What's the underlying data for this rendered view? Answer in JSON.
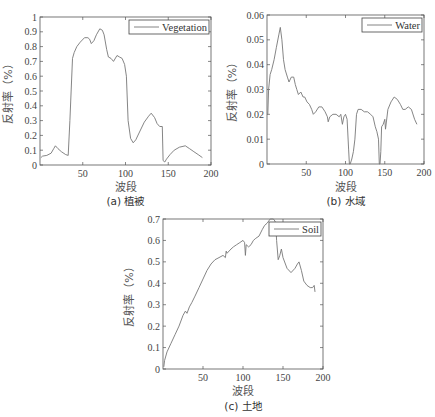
{
  "chart_data": [
    {
      "id": "vegetation",
      "type": "line",
      "caption": "(a) 植被",
      "xlabel": "波段",
      "ylabel": "反射率（%）",
      "legend": "Vegetation",
      "legend_position": "top-right",
      "xlim": [
        0,
        200
      ],
      "ylim": [
        0,
        1
      ],
      "xticks": [
        50,
        100,
        150,
        200
      ],
      "xtick_labels": [
        "50",
        "100",
        "150",
        "200"
      ],
      "yticks": [
        0,
        0.1,
        0.2,
        0.3,
        0.4,
        0.5,
        0.6,
        0.7,
        0.8,
        0.9,
        1
      ],
      "ytick_labels": [
        "0",
        "0.1",
        "0.2",
        "0.3",
        "0.4",
        "0.5",
        "0.6",
        "0.7",
        "0.8",
        "0.9",
        "1"
      ],
      "x": [
        1,
        3,
        8,
        13,
        16,
        18,
        21,
        25,
        30,
        33,
        35,
        38,
        40,
        43,
        47,
        52,
        56,
        58,
        60,
        63,
        66,
        70,
        73,
        75,
        78,
        80,
        83,
        86,
        90,
        93,
        96,
        99,
        101,
        103,
        106,
        109,
        112,
        117,
        122,
        127,
        130,
        134,
        137,
        140,
        143,
        144,
        146,
        148,
        152,
        157,
        163,
        170,
        175,
        180,
        185,
        190
      ],
      "values": [
        0.05,
        0.06,
        0.065,
        0.08,
        0.11,
        0.13,
        0.11,
        0.09,
        0.07,
        0.065,
        0.3,
        0.72,
        0.76,
        0.8,
        0.83,
        0.86,
        0.86,
        0.85,
        0.82,
        0.84,
        0.88,
        0.92,
        0.91,
        0.88,
        0.78,
        0.73,
        0.72,
        0.7,
        0.74,
        0.73,
        0.72,
        0.68,
        0.6,
        0.3,
        0.18,
        0.15,
        0.17,
        0.23,
        0.29,
        0.33,
        0.35,
        0.32,
        0.28,
        0.26,
        0.26,
        0.03,
        0.02,
        0.04,
        0.07,
        0.1,
        0.12,
        0.13,
        0.11,
        0.09,
        0.07,
        0.05
      ]
    },
    {
      "id": "water",
      "type": "line",
      "caption": "(b) 水域",
      "xlabel": "波段",
      "ylabel": "反射率（%）",
      "legend": "Water",
      "legend_position": "top-right",
      "xlim": [
        0,
        200
      ],
      "ylim": [
        0,
        0.06
      ],
      "xticks": [
        50,
        100,
        150,
        200
      ],
      "xtick_labels": [
        "50",
        "100",
        "150",
        "200"
      ],
      "yticks": [
        0,
        0.01,
        0.02,
        0.03,
        0.04,
        0.05,
        0.06
      ],
      "ytick_labels": [
        "0",
        "0.01",
        "0.02",
        "0.03",
        "0.04",
        "0.05",
        "0.06"
      ],
      "x": [
        1,
        2,
        4,
        6,
        9,
        12,
        15,
        17,
        19,
        21,
        23,
        26,
        28,
        31,
        34,
        36,
        38,
        40,
        43,
        46,
        48,
        51,
        54,
        57,
        59,
        62,
        66,
        70,
        74,
        77,
        78,
        80,
        84,
        88,
        92,
        94,
        96,
        98,
        100,
        102,
        104,
        105,
        106,
        108,
        110,
        112,
        114,
        116,
        120,
        124,
        128,
        132,
        135,
        138,
        140,
        142,
        143,
        144,
        145,
        146,
        148,
        150,
        151,
        154,
        158,
        162,
        166,
        170,
        173,
        176,
        180,
        184,
        188,
        191
      ],
      "values": [
        0.02,
        0.03,
        0.036,
        0.038,
        0.042,
        0.047,
        0.052,
        0.055,
        0.05,
        0.042,
        0.038,
        0.035,
        0.033,
        0.035,
        0.035,
        0.032,
        0.03,
        0.028,
        0.029,
        0.027,
        0.027,
        0.025,
        0.024,
        0.022,
        0.02,
        0.021,
        0.023,
        0.023,
        0.021,
        0.019,
        0.017,
        0.019,
        0.02,
        0.02,
        0.019,
        0.02,
        0.016,
        0.019,
        0.02,
        0.018,
        0.006,
        0.0,
        0.0,
        0.002,
        0.005,
        0.01,
        0.02,
        0.022,
        0.022,
        0.021,
        0.021,
        0.02,
        0.019,
        0.015,
        0.013,
        0.01,
        0.0,
        0.0,
        0.005,
        0.015,
        0.016,
        0.018,
        0.014,
        0.022,
        0.025,
        0.027,
        0.026,
        0.024,
        0.022,
        0.022,
        0.023,
        0.022,
        0.018,
        0.016
      ]
    },
    {
      "id": "soil",
      "type": "line",
      "caption": "(c) 土地",
      "xlabel": "波段",
      "ylabel": "反射率（%）",
      "legend": "Soil",
      "legend_position": "top-right",
      "xlim": [
        0,
        200
      ],
      "ylim": [
        0,
        0.7
      ],
      "xticks": [
        50,
        100,
        150,
        200
      ],
      "xtick_labels": [
        "50",
        "100",
        "150",
        "200"
      ],
      "yticks": [
        0,
        0.1,
        0.2,
        0.3,
        0.4,
        0.5,
        0.6,
        0.7
      ],
      "ytick_labels": [
        "0",
        "0.1",
        "0.2",
        "0.3",
        "0.4",
        "0.5",
        "0.6",
        "0.7"
      ],
      "x": [
        1,
        2,
        5,
        10,
        15,
        20,
        25,
        28,
        30,
        33,
        36,
        40,
        45,
        50,
        55,
        60,
        65,
        70,
        75,
        78,
        79,
        80,
        85,
        88,
        92,
        96,
        100,
        102,
        103,
        104,
        107,
        110,
        113,
        116,
        120,
        124,
        127,
        130,
        134,
        138,
        140,
        141,
        142,
        144,
        146,
        148,
        150,
        155,
        160,
        165,
        168,
        170,
        173,
        176,
        180,
        184,
        187,
        189,
        190
      ],
      "values": [
        0.01,
        0.04,
        0.08,
        0.12,
        0.16,
        0.2,
        0.25,
        0.27,
        0.26,
        0.29,
        0.31,
        0.34,
        0.38,
        0.42,
        0.46,
        0.49,
        0.51,
        0.52,
        0.53,
        0.52,
        0.55,
        0.54,
        0.56,
        0.57,
        0.58,
        0.59,
        0.6,
        0.59,
        0.53,
        0.58,
        0.57,
        0.58,
        0.6,
        0.61,
        0.62,
        0.65,
        0.67,
        0.68,
        0.7,
        0.7,
        0.69,
        0.67,
        0.6,
        0.51,
        0.53,
        0.56,
        0.52,
        0.47,
        0.45,
        0.47,
        0.49,
        0.5,
        0.46,
        0.41,
        0.39,
        0.38,
        0.38,
        0.39,
        0.36
      ]
    }
  ]
}
